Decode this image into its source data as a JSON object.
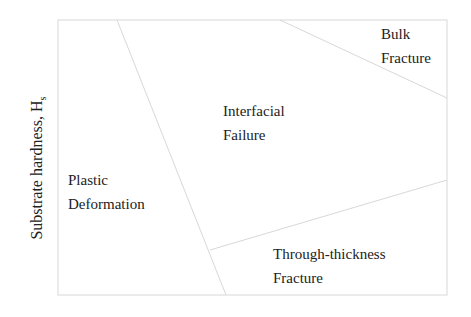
{
  "diagram": {
    "y_axis_label": "Substrate hardness, H",
    "y_axis_subscript": "s",
    "regions": [
      {
        "line1": "Bulk",
        "line2": "Fracture"
      },
      {
        "line1": "Interfacial",
        "line2": "Failure"
      },
      {
        "line1": "Plastic",
        "line2": "Deformation"
      },
      {
        "line1": "Through-thickness",
        "line2": "Fracture"
      }
    ],
    "line_color": "#d8d8d8"
  }
}
